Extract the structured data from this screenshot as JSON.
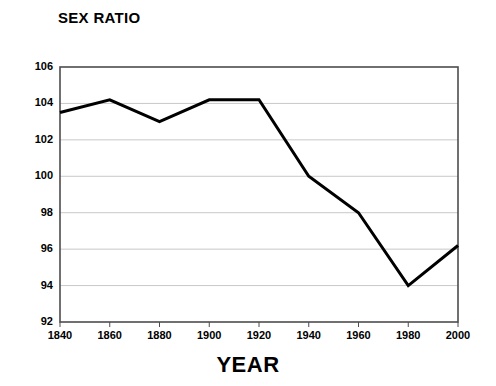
{
  "chart_data": {
    "type": "line",
    "title": "SEX RATIO",
    "xlabel": "YEAR",
    "ylabel": "",
    "x": [
      1840,
      1860,
      1880,
      1900,
      1920,
      1940,
      1960,
      1980,
      2000
    ],
    "values": [
      103.5,
      104.2,
      103.0,
      104.2,
      104.2,
      100.0,
      98.0,
      94.0,
      96.2
    ],
    "series": [
      {
        "name": "Sex ratio",
        "values": [
          103.5,
          104.2,
          103.0,
          104.2,
          104.2,
          100.0,
          98.0,
          94.0,
          96.2
        ]
      }
    ],
    "categories": [
      "1840",
      "1860",
      "1880",
      "1900",
      "1920",
      "1940",
      "1960",
      "1980",
      "2000"
    ],
    "xtick_labels": [
      "1840",
      "1860",
      "1880",
      "1900",
      "1920",
      "1940",
      "1960",
      "1980",
      "2000"
    ],
    "ytick_labels": [
      "106",
      "104",
      "102",
      "100",
      "98",
      "96",
      "94",
      "92"
    ],
    "ytick_values": [
      106,
      104,
      102,
      100,
      98,
      96,
      94,
      92
    ],
    "xlim": [
      1840,
      2000
    ],
    "ylim": [
      92,
      106
    ],
    "grid": true,
    "grid_axis": "y",
    "legend": false,
    "legend_position": "none",
    "line_color": "#000000",
    "grid_color": "#c8c8c8",
    "frame_color": "#4d4d4d",
    "background_color": "#ffffff"
  }
}
